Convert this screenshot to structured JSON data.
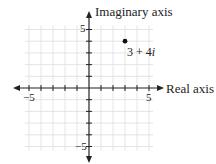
{
  "diagram": {
    "type": "complex-plane",
    "x_axis_label": "Real axis",
    "y_axis_label": "Imaginary axis",
    "x_range": [
      -5,
      5
    ],
    "y_range": [
      -5,
      5
    ],
    "tick_labels": {
      "x_neg": "−5",
      "x_pos": "5",
      "y_pos": "5",
      "y_neg": "−5"
    },
    "grid": true,
    "colors": {
      "grid": "#dddddd",
      "axis": "#222222",
      "point": "#111111"
    },
    "points": [
      {
        "real": 3,
        "imag": 4,
        "label_real": "3",
        "label_op": "+",
        "label_imag_coef": "4",
        "label_unit": "i"
      }
    ]
  }
}
